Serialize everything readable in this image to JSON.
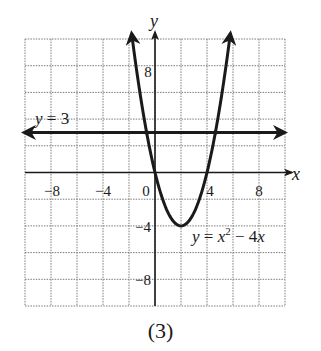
{
  "caption": "(3)",
  "chart_data": {
    "type": "line",
    "title": "",
    "caption": "(3)",
    "xlabel": "x",
    "ylabel": "y",
    "xlim": [
      -10,
      10
    ],
    "ylim": [
      -10,
      10
    ],
    "grid": true,
    "grid_step": 2,
    "x_ticks": [
      -8,
      -4,
      0,
      4,
      8
    ],
    "x_tick_labels": [
      "−8",
      "−4",
      "0",
      "4",
      "8"
    ],
    "y_ticks": [
      8,
      -4,
      -8
    ],
    "y_tick_labels": [
      "8",
      "−4",
      "−8"
    ],
    "series": [
      {
        "name": "y = x² − 4x",
        "label": "y = x² − 4x",
        "equation": "y = x^2 - 4x",
        "kind": "parabola",
        "x_range": [
          -1.8,
          5.8
        ],
        "points": [
          [
            -1.8,
            10.44
          ],
          [
            -1,
            5
          ],
          [
            0,
            0
          ],
          [
            1,
            -3
          ],
          [
            2,
            -4
          ],
          [
            3,
            -3
          ],
          [
            4,
            0
          ],
          [
            5,
            5
          ],
          [
            5.8,
            10.44
          ]
        ],
        "key_points": {
          "roots": [
            0,
            4
          ],
          "vertex": [
            2,
            -4
          ]
        }
      },
      {
        "name": "y = 3",
        "label": "y = 3",
        "equation": "y = 3",
        "kind": "horizontal-line",
        "value": 3
      }
    ],
    "annotations": [
      {
        "text": "y = 3",
        "x": -8.8,
        "y": 3.8
      },
      {
        "text": "y = x² − 4x",
        "x": 2.8,
        "y": -4.8
      }
    ]
  },
  "labels": {
    "x_axis": "x",
    "y_axis": "y",
    "xt_m8": "−8",
    "xt_m4": "−4",
    "xt_0": "0",
    "xt_4": "4",
    "xt_8": "8",
    "yt_8": "8",
    "yt_m4": "−4",
    "yt_m8": "−8",
    "line_label_y": "y",
    "line_label_rest": " = 3",
    "parab_y": "y",
    "parab_eq": " = ",
    "parab_x": "x",
    "parab_exp": "2",
    "parab_rest": " − 4",
    "parab_x2": "x"
  }
}
